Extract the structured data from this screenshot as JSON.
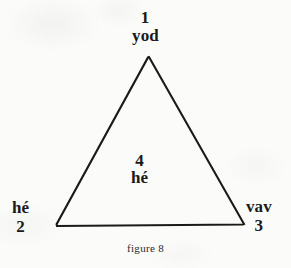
{
  "figure": {
    "caption": "figure 8",
    "background_color": "#fbfbf9",
    "ink_color": "#1a1a1a",
    "stroke_width": 2.1
  },
  "shape": {
    "type": "triangle",
    "vertices": [
      {
        "id": "apex",
        "x": 149,
        "y": 57
      },
      {
        "id": "bottom-right",
        "x": 243,
        "y": 223
      },
      {
        "id": "bottom-left",
        "x": 57,
        "y": 225
      }
    ],
    "path": "M 149 57 L 243 223 L 57 225 Z"
  },
  "labels": {
    "top": {
      "number": "1",
      "name": "yod"
    },
    "bottom_left": {
      "name": "hé",
      "number": "2"
    },
    "bottom_right": {
      "name": "vav",
      "number": "3"
    },
    "center": {
      "number": "4",
      "name": "hé"
    }
  }
}
